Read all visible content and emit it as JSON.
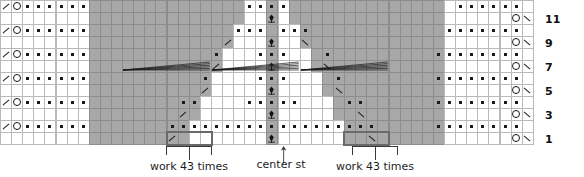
{
  "chart": {
    "kind": "knitting-stitch-chart",
    "columns": 48,
    "rows": 12,
    "cell_width": 11.1,
    "cell_height": 12,
    "origin_x": 0,
    "origin_y": 0,
    "colors": {
      "background": "#ffffff",
      "grid_line": "#b9b9b9",
      "shaded_cell": "#a8a8a8",
      "shaded_grid_line": "#8d8d8d",
      "symbol": "#1a1a1a",
      "repeat_box": "#6a6a6a",
      "bracket": "#3a3a3a",
      "text": "#111111"
    },
    "symbol_legend": [
      {
        "key": "dot",
        "name": "purl-stitch-dot"
      },
      {
        "key": "yo",
        "name": "yarn-over-circle"
      },
      {
        "key": "k2tog",
        "name": "k2tog-right-slant"
      },
      {
        "key": "ssk",
        "name": "ssk-left-slant"
      },
      {
        "key": "cdd",
        "name": "central-double-decrease"
      },
      {
        "key": "gather",
        "name": "gathered-stitch-fan"
      }
    ]
  },
  "row_numbers": {
    "values": [
      "11",
      "9",
      "7",
      "5",
      "3",
      "1"
    ],
    "rows": [
      1,
      3,
      5,
      7,
      9,
      11
    ],
    "x": 545
  },
  "labels": {
    "work_left": "work 43 times",
    "center": "center st",
    "work_right": "work 43 times"
  },
  "repeat_boxes": [
    {
      "name": "repeat-box-left",
      "col": 15,
      "span": 4,
      "row": 11
    },
    {
      "name": "repeat-box-right",
      "col": 31,
      "span": 4,
      "row": 11
    }
  ],
  "brackets": [
    {
      "name": "bracket-left",
      "x": 166,
      "y": 146,
      "width": 46,
      "label_x": 120,
      "label_y": 160
    },
    {
      "name": "bracket-right",
      "x": 352,
      "y": 146,
      "width": 46,
      "label_x": 306,
      "label_y": 160
    }
  ],
  "center_marker": {
    "x": 280,
    "y": 146,
    "label_x": 236,
    "label_y": 158
  },
  "shading": {
    "description": "Two mirrored staircase blocks of gray cells flanking the center stitch column; column 24 (center) is fully shaded.",
    "left_block_rows": [
      {
        "row": 0,
        "start": 8,
        "end": 21
      },
      {
        "row": 1,
        "start": 8,
        "end": 21
      },
      {
        "row": 2,
        "start": 8,
        "end": 20
      },
      {
        "row": 3,
        "start": 8,
        "end": 20
      },
      {
        "row": 4,
        "start": 8,
        "end": 19
      },
      {
        "row": 5,
        "start": 8,
        "end": 19
      },
      {
        "row": 6,
        "start": 8,
        "end": 18
      },
      {
        "row": 7,
        "start": 8,
        "end": 18
      },
      {
        "row": 8,
        "start": 8,
        "end": 17
      },
      {
        "row": 9,
        "start": 8,
        "end": 17
      },
      {
        "row": 10,
        "start": 8,
        "end": 16
      },
      {
        "row": 11,
        "start": 8,
        "end": 16
      }
    ],
    "right_block_rows": [
      {
        "row": 0,
        "start": 26,
        "end": 39
      },
      {
        "row": 1,
        "start": 26,
        "end": 39
      },
      {
        "row": 2,
        "start": 27,
        "end": 39
      },
      {
        "row": 3,
        "start": 27,
        "end": 39
      },
      {
        "row": 4,
        "start": 28,
        "end": 39
      },
      {
        "row": 5,
        "start": 28,
        "end": 39
      },
      {
        "row": 6,
        "start": 29,
        "end": 39
      },
      {
        "row": 7,
        "start": 29,
        "end": 39
      },
      {
        "row": 8,
        "start": 30,
        "end": 39
      },
      {
        "row": 9,
        "start": 30,
        "end": 39
      },
      {
        "row": 10,
        "start": 31,
        "end": 39
      },
      {
        "row": 11,
        "start": 31,
        "end": 39
      }
    ],
    "center_column": 24
  },
  "cells": {
    "note": "Per-row symbol placement. Row 0 = top (row 12 of pattern), row 11 = bottom (row 1). 'dot' on even rows across plain areas; odd rows carry k2tog/yo at the left edge and yo/ssk at the right edge.",
    "rows": [
      {
        "index": 0,
        "pattern_row": 12,
        "k2tog": [
          0
        ],
        "yo": [
          1
        ],
        "dots": [
          2,
          3,
          4,
          5,
          6,
          7,
          22,
          23,
          24,
          25,
          41,
          42,
          43,
          44,
          45,
          46
        ],
        "ssk": [],
        "yo_right": [],
        "cdd": [],
        "gathers": []
      },
      {
        "index": 1,
        "pattern_row": 11,
        "k2tog": [],
        "yo": [],
        "dots": [
          24
        ],
        "ssk": [
          47
        ],
        "yo_right": [
          46
        ],
        "cdd": [
          24
        ],
        "gathers": []
      },
      {
        "index": 2,
        "pattern_row": 10,
        "k2tog": [
          0
        ],
        "yo": [
          1
        ],
        "dots": [
          2,
          3,
          4,
          5,
          6,
          7,
          21,
          22,
          23,
          25,
          26,
          27,
          40,
          41,
          42,
          43,
          44,
          45,
          46
        ],
        "ssk": [],
        "yo_right": [],
        "cdd": [],
        "gathers": []
      },
      {
        "index": 3,
        "pattern_row": 9,
        "k2tog": [
          20
        ],
        "yo": [],
        "dots": [
          24
        ],
        "ssk": [
          27,
          47
        ],
        "yo_right": [
          46
        ],
        "cdd": [
          24
        ],
        "gathers": []
      },
      {
        "index": 4,
        "pattern_row": 8,
        "k2tog": [
          0
        ],
        "yo": [
          1
        ],
        "dots": [
          2,
          3,
          4,
          5,
          6,
          7,
          19,
          23,
          24,
          25,
          29,
          39,
          40,
          41,
          42,
          43,
          44,
          45,
          46
        ],
        "ssk": [],
        "yo_right": [],
        "cdd": [],
        "gathers": []
      },
      {
        "index": 5,
        "pattern_row": 7,
        "k2tog": [
          19
        ],
        "yo": [],
        "dots": [],
        "ssk": [
          29,
          47
        ],
        "yo_right": [
          46
        ],
        "cdd": [
          24
        ],
        "gathers": [
          {
            "start": 11,
            "span": 8
          },
          {
            "start": 19,
            "span": 8
          },
          {
            "start": 27,
            "span": 8
          }
        ]
      },
      {
        "index": 6,
        "pattern_row": 6,
        "k2tog": [
          0
        ],
        "yo": [
          1
        ],
        "dots": [
          2,
          3,
          4,
          5,
          6,
          7,
          18,
          23,
          24,
          25,
          30,
          39,
          40,
          41,
          42,
          43,
          44,
          45,
          46
        ],
        "ssk": [],
        "yo_right": [],
        "cdd": [],
        "gathers": []
      },
      {
        "index": 7,
        "pattern_row": 5,
        "k2tog": [
          18
        ],
        "yo": [],
        "dots": [
          24
        ],
        "ssk": [
          30,
          47
        ],
        "yo_right": [
          46
        ],
        "cdd": [
          24
        ],
        "gathers": []
      },
      {
        "index": 8,
        "pattern_row": 4,
        "k2tog": [
          0
        ],
        "yo": [
          1
        ],
        "dots": [
          2,
          3,
          4,
          5,
          6,
          7,
          16,
          17,
          22,
          23,
          24,
          25,
          26,
          31,
          32,
          39,
          40,
          41,
          42,
          43,
          44,
          45,
          46
        ],
        "ssk": [],
        "yo_right": [],
        "cdd": [],
        "gathers": []
      },
      {
        "index": 9,
        "pattern_row": 3,
        "k2tog": [
          16
        ],
        "yo": [],
        "dots": [
          24
        ],
        "ssk": [
          32,
          47
        ],
        "yo_right": [
          46
        ],
        "cdd": [
          24
        ],
        "gathers": []
      },
      {
        "index": 10,
        "pattern_row": 2,
        "k2tog": [
          0
        ],
        "yo": [
          1
        ],
        "dots": [
          2,
          3,
          4,
          5,
          6,
          7,
          15,
          16,
          17,
          18,
          19,
          20,
          21,
          22,
          23,
          24,
          25,
          26,
          27,
          28,
          29,
          30,
          31,
          32,
          33,
          39,
          40,
          41,
          42,
          43,
          44,
          45,
          46
        ],
        "ssk": [],
        "yo_right": [],
        "cdd": [],
        "gathers": []
      },
      {
        "index": 11,
        "pattern_row": 1,
        "k2tog": [
          15
        ],
        "yo": [],
        "dots": [
          24
        ],
        "ssk": [
          33,
          47
        ],
        "yo_right": [
          46
        ],
        "cdd": [
          24
        ],
        "gathers": []
      }
    ]
  }
}
